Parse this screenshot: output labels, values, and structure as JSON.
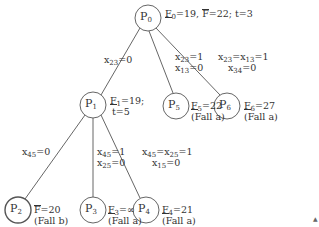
{
  "diagram": {
    "type": "branch-and-bound tree",
    "nodes": [
      {
        "id": "P0",
        "label": "P",
        "sub": "0",
        "annotation": {
          "lower": "F̲0=19",
          "upper": "F̄=22",
          "extra": "t=3"
        }
      },
      {
        "id": "P1",
        "label": "P",
        "sub": "1",
        "annotation": {
          "lower": "F̲1=19;",
          "extra": "t=5"
        }
      },
      {
        "id": "P5",
        "label": "P",
        "sub": "5",
        "annotation": {
          "lower": "F̲5=22",
          "case": "(Fall a)"
        }
      },
      {
        "id": "P6",
        "label": "P",
        "sub": "6",
        "annotation": {
          "lower": "F̲6=27",
          "case": "(Fall a)"
        }
      },
      {
        "id": "P2",
        "label": "P",
        "sub": "2",
        "annotation": {
          "upper": "F̄=20",
          "case": "(Fall b)"
        }
      },
      {
        "id": "P3",
        "label": "P",
        "sub": "3",
        "annotation": {
          "lower": "F̲3=∞",
          "case": "(Fall a)"
        }
      },
      {
        "id": "P4",
        "label": "P",
        "sub": "4",
        "annotation": {
          "lower": "F̲4=21",
          "case": "(Fall a)"
        }
      }
    ],
    "edges": [
      {
        "from": "P0",
        "to": "P1",
        "lines": [
          "x23=0"
        ]
      },
      {
        "from": "P0",
        "to": "P5",
        "lines": [
          "x23=1",
          "x13=0"
        ]
      },
      {
        "from": "P0",
        "to": "P6",
        "lines": [
          "x23=x13=1",
          "x34=0"
        ]
      },
      {
        "from": "P1",
        "to": "P2",
        "lines": [
          "x45=0"
        ]
      },
      {
        "from": "P1",
        "to": "P3",
        "lines": [
          "x45=1",
          "x25=0"
        ]
      },
      {
        "from": "P1",
        "to": "P4",
        "lines": [
          "x45=x25=1",
          "x15=0"
        ]
      }
    ]
  },
  "text": {
    "p0_ann": {
      "F": "F",
      "s0": "0",
      "v0": "=19, ",
      "F2": "F",
      "v1": "=22; t=3"
    },
    "p1_ann": {
      "F": "F",
      "s": "1",
      "v": "=19;",
      "t": "t=5"
    },
    "p5_ann": {
      "F": "F",
      "s": "5",
      "v": "=22",
      "c": "(Fall a)"
    },
    "p6_ann": {
      "F": "F",
      "s": "6",
      "v": "=27",
      "c": "(Fall a)"
    },
    "p2_ann": {
      "F": "F",
      "v": "=20",
      "c": "(Fall b)"
    },
    "p3_ann": {
      "F": "F",
      "s": "3",
      "v": "=∞",
      "c": "(Fall a)"
    },
    "p4_ann": {
      "F": "F",
      "s": "4",
      "v": "=21",
      "c": "(Fall a)"
    },
    "e01": {
      "x": "x",
      "s": "23",
      "v": "=0"
    },
    "e05": {
      "x": "x",
      "s1": "23",
      "v1": "=1",
      "s2": "13",
      "v2": "=0"
    },
    "e06": {
      "s1": "23",
      "s2": "13",
      "v1": "=1",
      "s3": "34",
      "v3": "=0"
    },
    "e12": {
      "s": "45",
      "v": "=0"
    },
    "e13": {
      "s1": "45",
      "v1": "=1",
      "s2": "25",
      "v2": "=0"
    },
    "e14": {
      "s1": "45",
      "s2": "25",
      "v1": "=1",
      "s3": "15",
      "v3": "=0"
    },
    "node_letter": "P",
    "stray_mark": "▲"
  }
}
